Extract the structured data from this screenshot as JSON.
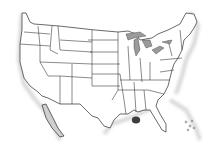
{
  "map": {
    "title": "",
    "region": "Contiguous United States",
    "style": "Grayscale outline map with state borders",
    "colors": {
      "land": "#ffffff",
      "borders": "#2a2a2a",
      "coast_shadow": "#b8b8b8",
      "lakes": "#9a9a9a",
      "highlight": "#3d3d3d"
    },
    "features": [
      {
        "name": "Great Lakes",
        "type": "lakes"
      },
      {
        "name": "Gulf of Mexico dark spot",
        "type": "highlight-marker",
        "near": "Louisiana coast"
      },
      {
        "name": "Bahamas",
        "type": "islands"
      },
      {
        "name": "Baja California",
        "type": "peninsula"
      }
    ]
  }
}
